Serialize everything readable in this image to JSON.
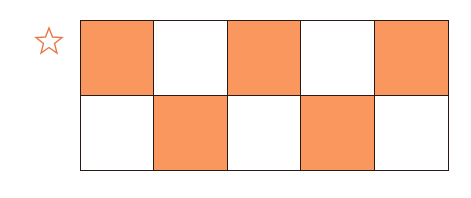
{
  "marker": {
    "icon": "star-outline-icon",
    "color": "#e8784a"
  },
  "grid": {
    "rows": 2,
    "columns": 5,
    "shaded_color": "#f9975f",
    "unshaded_color": "#ffffff",
    "border_color": "#2a1a14",
    "cells": [
      [
        true,
        false,
        true,
        false,
        true
      ],
      [
        false,
        true,
        false,
        true,
        false
      ]
    ],
    "shaded_count": 5,
    "total_count": 10
  }
}
